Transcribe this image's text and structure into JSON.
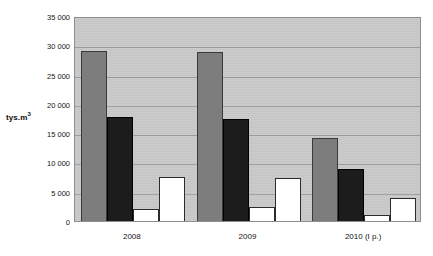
{
  "chart_data": {
    "type": "bar",
    "title": "",
    "subtitle": "",
    "xlabel": "",
    "ylabel": "tys.m3",
    "ylabel_base": "tys.m",
    "ylabel_sup": "3",
    "categories": [
      "2008",
      "2009",
      "2010 (I p.)"
    ],
    "series": [
      {
        "name": "series-1",
        "color": "#7d7d7d",
        "values": [
          29100,
          28800,
          14100
        ]
      },
      {
        "name": "series-2",
        "color": "#1c1c1c",
        "values": [
          17700,
          17400,
          8900
        ]
      },
      {
        "name": "series-3",
        "color": "#ffffff",
        "values": [
          2100,
          2400,
          1000
        ]
      },
      {
        "name": "series-4",
        "color": "#ffffff",
        "values": [
          7600,
          7300,
          4000
        ]
      }
    ],
    "ylim": [
      0,
      35000
    ],
    "ytick_values": [
      0,
      5000,
      10000,
      15000,
      20000,
      25000,
      30000,
      35000
    ],
    "ytick_labels": [
      "0",
      "5 000",
      "10 000",
      "15 000",
      "20 000",
      "25 000",
      "30 000",
      "35 000"
    ],
    "grid": true,
    "legend": "none",
    "plot_background": "#c9c9c9",
    "figure_background": "#ffffff"
  }
}
